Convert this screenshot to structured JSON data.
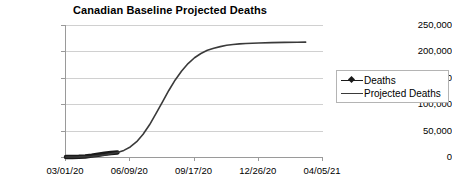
{
  "chart": {
    "title": "Canadian Baseline Projected Deaths"
  },
  "legend": {
    "items": [
      {
        "label": "Deaths",
        "key": "line-with-diamond-marker",
        "color": "#1a1a1a"
      },
      {
        "label": "Projected Deaths",
        "key": "plain-line",
        "color": "#3a3a3a"
      }
    ]
  },
  "chart_data": {
    "type": "line",
    "title": "Canadian Baseline Projected Deaths",
    "xlabel": "",
    "ylabel": "",
    "grid": true,
    "legend_position": "right",
    "ylim": [
      0,
      250000
    ],
    "ytick_labels": [
      "250,000",
      "200,000",
      "150,000",
      "100,000",
      "50,000",
      "0"
    ],
    "ytick_values": [
      250000,
      200000,
      150000,
      100000,
      50000,
      0
    ],
    "xtick_labels": [
      "03/01/20",
      "06/09/20",
      "09/17/20",
      "12/26/20",
      "04/05/21"
    ],
    "xtick_days": [
      0,
      100,
      200,
      300,
      400
    ],
    "xlim_days": [
      0,
      400
    ],
    "series": [
      {
        "name": "Deaths",
        "marker": "diamond",
        "color": "#1a1a1a",
        "x_days": [
          0,
          10,
          20,
          30,
          40,
          50,
          60,
          70,
          80
        ],
        "values": [
          0,
          50,
          300,
          1100,
          2600,
          4400,
          6200,
          7600,
          8500
        ]
      },
      {
        "name": "Projected Deaths",
        "marker": "none",
        "color": "#3a3a3a",
        "x_days": [
          0,
          20,
          40,
          60,
          80,
          90,
          100,
          110,
          120,
          130,
          140,
          150,
          160,
          170,
          180,
          190,
          200,
          210,
          220,
          230,
          240,
          250,
          260,
          270,
          280,
          300,
          320,
          340,
          360,
          373
        ],
        "values": [
          0,
          200,
          1200,
          4000,
          8500,
          12500,
          19000,
          29000,
          43000,
          61000,
          82000,
          104000,
          126000,
          146000,
          163000,
          177000,
          188000,
          196000,
          202000,
          206000,
          209000,
          211500,
          213000,
          214200,
          215000,
          216000,
          216600,
          217000,
          217300,
          217500
        ]
      }
    ]
  }
}
